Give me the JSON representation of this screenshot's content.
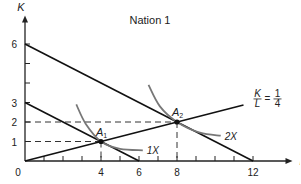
{
  "chart_data": {
    "type": "line",
    "title": "Nation 1",
    "xlabel": "L",
    "ylabel": "K",
    "xlim": [
      0,
      13.5
    ],
    "ylim": [
      0,
      7
    ],
    "x_ticks_labeled": [
      0,
      4,
      6,
      8,
      12
    ],
    "x_ticks_minor": [
      1,
      2,
      3,
      4,
      5,
      6,
      7,
      8,
      9,
      10,
      11,
      12
    ],
    "y_ticks_labeled": [
      1,
      2,
      3,
      6
    ],
    "y_ticks_minor": [
      1,
      2,
      3,
      4,
      5,
      6
    ],
    "origin_label": "0",
    "isocost_lines": [
      {
        "name": "isocost-1",
        "points": [
          [
            0,
            3
          ],
          [
            6,
            0
          ]
        ]
      },
      {
        "name": "isocost-2",
        "points": [
          [
            0,
            6
          ],
          [
            12,
            0
          ]
        ]
      }
    ],
    "ray": {
      "name": "K/L = 1/4",
      "slope": 0.25,
      "x_end": 11.5,
      "label_num": "K",
      "label_den": "L",
      "label_val_num": "1",
      "label_val_den": "4"
    },
    "isoquants": [
      {
        "label": "1X",
        "points": [
          [
            2.7,
            2.9
          ],
          [
            3.2,
            1.9
          ],
          [
            4,
            1
          ],
          [
            5,
            0.62
          ],
          [
            6.2,
            0.55
          ]
        ]
      },
      {
        "label": "2X",
        "points": [
          [
            6.5,
            3.9
          ],
          [
            7.1,
            2.8
          ],
          [
            8,
            2
          ],
          [
            9.2,
            1.45
          ],
          [
            10.3,
            1.3
          ]
        ]
      }
    ],
    "points": [
      {
        "label": "A",
        "sub": "1",
        "x": 4,
        "y": 1
      },
      {
        "label": "A",
        "sub": "2",
        "x": 8,
        "y": 2
      }
    ],
    "dashed_guides": [
      {
        "from": [
          0,
          1
        ],
        "to": [
          4,
          1
        ]
      },
      {
        "from": [
          4,
          1
        ],
        "to": [
          4,
          0
        ]
      },
      {
        "from": [
          0,
          2
        ],
        "to": [
          8,
          2
        ]
      },
      {
        "from": [
          8,
          2
        ],
        "to": [
          8,
          0
        ]
      }
    ]
  }
}
